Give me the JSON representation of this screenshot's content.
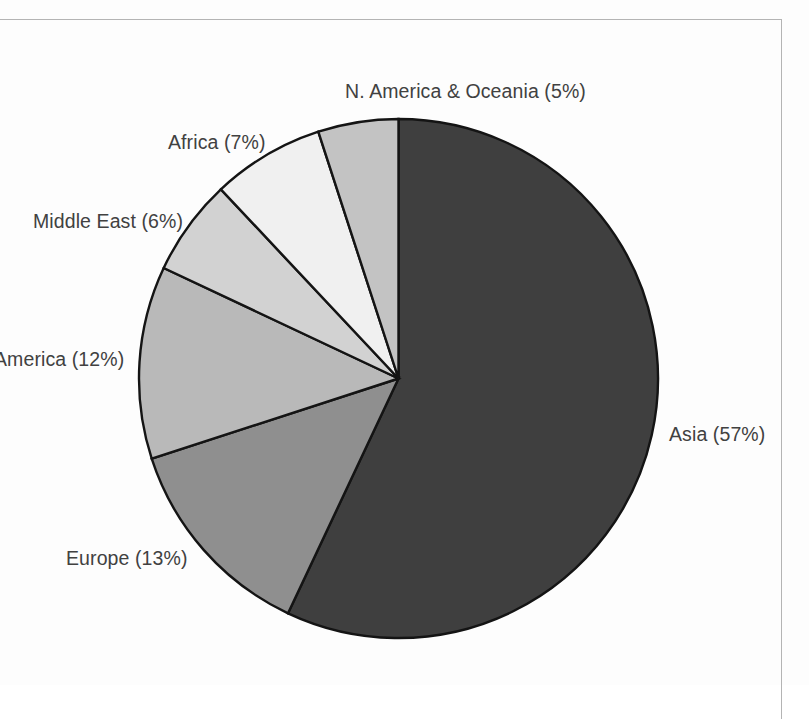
{
  "figure": {
    "background_color": "#fdfdfd",
    "frame_color": "#b4b4b4",
    "outline_color": "#141414"
  },
  "chart_data": {
    "type": "pie",
    "title": "",
    "subtitle": "",
    "xlabel": "",
    "ylabel": "",
    "legend_position": "none",
    "labels_position": "outside-callout",
    "start_angle_deg": 0,
    "direction": "clockwise",
    "units": "percent",
    "total": 100,
    "categories": [
      "Asia",
      "Europe",
      "America",
      "Middle East",
      "Africa",
      "N. America & Oceania"
    ],
    "values": [
      57,
      13,
      12,
      6,
      7,
      5
    ],
    "slices": [
      {
        "name": "Asia",
        "value": 57,
        "label": "Asia (57%)",
        "color": "#3f3f3f",
        "label_x": 669,
        "label_y": 425,
        "label_align": "left",
        "clipped": false
      },
      {
        "name": "Europe",
        "value": 13,
        "label": "Europe (13%)",
        "color": "#8f8f8f",
        "label_x": 66,
        "label_y": 549,
        "label_align": "left",
        "clipped": false
      },
      {
        "name": "America",
        "value": 12,
        "label": "America (12%)",
        "color": "#b9b9b9",
        "label_x": -6,
        "label_y": 350,
        "label_align": "left",
        "clipped": true
      },
      {
        "name": "Middle East",
        "value": 6,
        "label": "Middle East (6%)",
        "color": "#d2d2d2",
        "label_x": 33,
        "label_y": 212,
        "label_align": "left",
        "clipped": false
      },
      {
        "name": "Africa",
        "value": 7,
        "label": "Africa (7%)",
        "color": "#f0f0f0",
        "label_x": 168,
        "label_y": 133,
        "label_align": "left",
        "clipped": false
      },
      {
        "name": "N. America & Oceania",
        "value": 5,
        "label": "N. America & Oceania (5%)",
        "color": "#c3c3c3",
        "label_x": 345,
        "label_y": 82,
        "label_align": "left",
        "clipped": false
      }
    ]
  },
  "caption": {
    "text": ""
  }
}
